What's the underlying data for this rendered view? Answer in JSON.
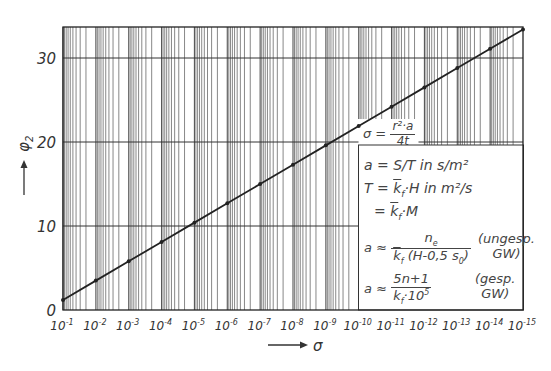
{
  "chart_data": {
    "type": "line",
    "title": "",
    "xlabel": "σ",
    "ylabel": "φ2",
    "x_scale": "log (descending)",
    "x_ticks": [
      "10^-1",
      "10^-2",
      "10^-3",
      "10^-4",
      "10^-5",
      "10^-6",
      "10^-7",
      "10^-8",
      "10^-9",
      "10^-10",
      "10^-11",
      "10^-12",
      "10^-13",
      "10^-14",
      "10^-15"
    ],
    "x": [
      0.1,
      0.01,
      0.001,
      0.0001,
      1e-05,
      1e-06,
      1e-07,
      1e-08,
      1e-09,
      1e-10,
      1e-11,
      1e-12,
      1e-13,
      1e-14,
      1e-15
    ],
    "y_ticks": [
      0,
      10,
      20,
      30
    ],
    "ylim": [
      0,
      33.5
    ],
    "series": [
      {
        "name": "φ2(σ)",
        "values": [
          1.2,
          3.5,
          5.8,
          8.1,
          10.4,
          12.7,
          15.0,
          17.3,
          19.6,
          21.9,
          24.2,
          26.5,
          28.8,
          31.1,
          33.4
        ]
      }
    ],
    "grid": true,
    "legend_position": "lower right (formula box)"
  },
  "axes": {
    "y_label": "φ",
    "y_label_sub": "2",
    "y_arrow": "→",
    "x_label": "σ",
    "x_arrow": "→",
    "y_tick_labels": [
      "0",
      "10",
      "20",
      "30"
    ],
    "x_tick_labels": [
      {
        "base": "10",
        "exp": "-1"
      },
      {
        "base": "10",
        "exp": "-2"
      },
      {
        "base": "10",
        "exp": "-3"
      },
      {
        "base": "10",
        "exp": "-4"
      },
      {
        "base": "10",
        "exp": "-5"
      },
      {
        "base": "10",
        "exp": "-6"
      },
      {
        "base": "10",
        "exp": "-7"
      },
      {
        "base": "10",
        "exp": "-8"
      },
      {
        "base": "10",
        "exp": "-9"
      },
      {
        "base": "10",
        "exp": "-10"
      },
      {
        "base": "10",
        "exp": "-11"
      },
      {
        "base": "10",
        "exp": "-12"
      },
      {
        "base": "10",
        "exp": "-13"
      },
      {
        "base": "10",
        "exp": "-14"
      },
      {
        "base": "10",
        "exp": "-15"
      }
    ]
  },
  "legend": {
    "sigma_lhs": "σ =",
    "sigma_num": "r²·a",
    "sigma_den": "4t",
    "a_def": "a = S/T in s/m²",
    "t_def": "T = k_f ·H in m²/s",
    "t_def_lhs": "T =",
    "t_def_kf": "k",
    "t_def_rest": "·H in m²/s",
    "m_def_lhs": "=",
    "m_def_rest": "·M",
    "kf": "k",
    "kf_sub": "f",
    "a_approx": "a ≈",
    "unconf_num": "n",
    "unconf_num_sub": "e",
    "unconf_den_rest": "(H-0,5 s",
    "unconf_den_sub": "0",
    "unconf_den_close": ")",
    "unconf_note_1": "(ungesp.",
    "unconf_note_2": "GW)",
    "conf_num": "5n+1",
    "conf_den_rest": "·10",
    "conf_den_exp": "5",
    "conf_note_1": "(gesp.",
    "conf_note_2": "GW)"
  }
}
